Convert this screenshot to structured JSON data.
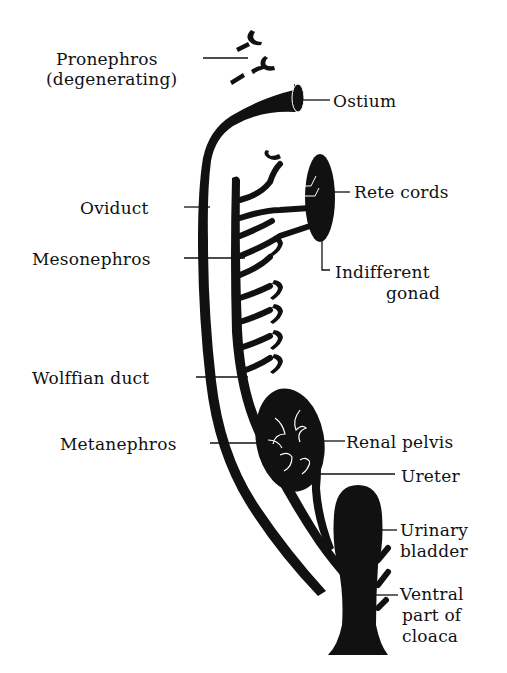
{
  "diagram": {
    "colors": {
      "ink": "#111111",
      "background": "#ffffff"
    },
    "labels": [
      {
        "id": "pronephros",
        "text": "Pronephros",
        "sub": "(degenerating)",
        "side": "left"
      },
      {
        "id": "ostium",
        "text": "Ostium",
        "side": "right"
      },
      {
        "id": "oviduct",
        "text": "Oviduct",
        "side": "left"
      },
      {
        "id": "rete-cords",
        "text": "Rete cords",
        "side": "right"
      },
      {
        "id": "mesonephros",
        "text": "Mesonephros",
        "side": "left"
      },
      {
        "id": "indifferent-gonad",
        "text": "Indifferent",
        "sub": "gonad",
        "side": "right"
      },
      {
        "id": "wolffian-duct",
        "text": "Wolffian duct",
        "side": "left"
      },
      {
        "id": "metanephros",
        "text": "Metanephros",
        "side": "left"
      },
      {
        "id": "renal-pelvis",
        "text": "Renal pelvis",
        "side": "right"
      },
      {
        "id": "ureter",
        "text": "Ureter",
        "side": "right"
      },
      {
        "id": "urinary-bladder",
        "text": "Urinary",
        "sub": "bladder",
        "side": "right"
      },
      {
        "id": "ventral-cloaca",
        "text": "Ventral",
        "sub": "part of",
        "sub2": "cloaca",
        "side": "right"
      }
    ]
  }
}
